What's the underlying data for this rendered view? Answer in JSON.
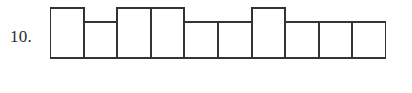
{
  "exercise": {
    "number_label": "10."
  },
  "chart_data": {
    "type": "bar",
    "title": "",
    "subtitle": "",
    "xlabel": "",
    "ylabel": "",
    "categories": [
      "1",
      "2",
      "3",
      "4",
      "5",
      "6",
      "7",
      "8",
      "9",
      "10"
    ],
    "values": [
      2,
      1,
      2,
      2,
      1,
      1,
      2,
      1,
      1,
      1
    ],
    "ylim": [
      0,
      2
    ],
    "grid": false,
    "legend": null,
    "bar_fill_color": "#ffffff",
    "bar_stroke_color": "#333333",
    "baseline_color": "#333333",
    "stroke_width": 2,
    "bar_count": 10,
    "tall_bar_indices": [
      1,
      3,
      4,
      7
    ],
    "short_bar_indices": [
      2,
      5,
      6,
      8,
      9,
      10
    ],
    "annotations": []
  },
  "geometry": {
    "baseline_y": 53,
    "tall_top_y": 3,
    "short_top_y": 17,
    "bar_width": 33.6,
    "chart_left": 50,
    "chart_right": 386
  }
}
